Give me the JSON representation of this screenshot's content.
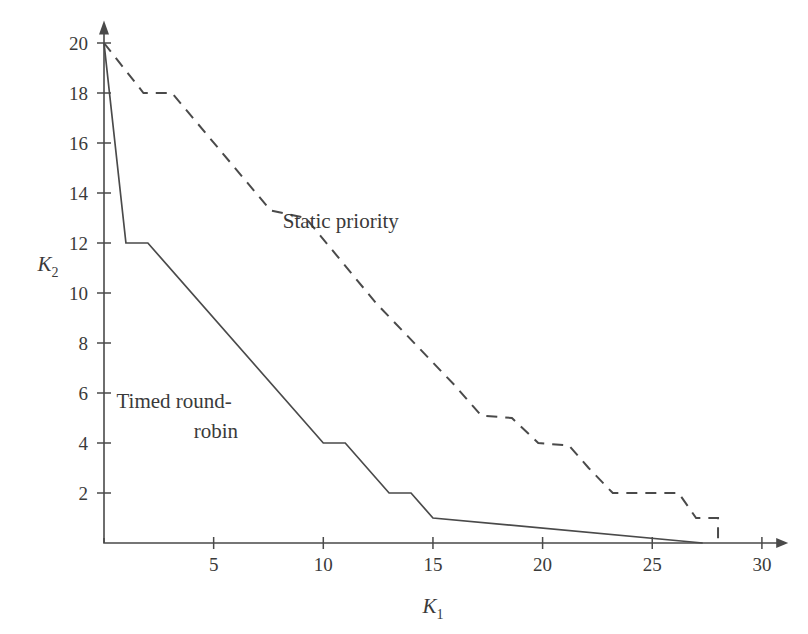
{
  "chart_data": {
    "type": "line",
    "title": "",
    "xlabel": "K1",
    "ylabel": "K2",
    "xlabel_base": "K",
    "xlabel_sub": "1",
    "ylabel_base": "K",
    "ylabel_sub": "2",
    "xlim": [
      0,
      31
    ],
    "ylim": [
      0,
      21
    ],
    "grid": false,
    "legend_position": "inline-annotation",
    "xticks": [
      5,
      10,
      15,
      20,
      25,
      30
    ],
    "xtick_labels": [
      "5",
      "10",
      "15",
      "20",
      "25",
      "30"
    ],
    "yticks": [
      2,
      4,
      6,
      8,
      10,
      12,
      14,
      16,
      18,
      20
    ],
    "ytick_labels": [
      "2",
      "4",
      "6",
      "8",
      "10",
      "12",
      "14",
      "16",
      "18",
      "20"
    ],
    "series": [
      {
        "name": "Timed round-robin",
        "style": "solid",
        "label_text_line1": "Timed round-",
        "label_text_line2": "robin",
        "points": [
          [
            0,
            20
          ],
          [
            1,
            12
          ],
          [
            2,
            12
          ],
          [
            10,
            4
          ],
          [
            11,
            4
          ],
          [
            13,
            2
          ],
          [
            14,
            2
          ],
          [
            15,
            1
          ],
          [
            27.3,
            0
          ]
        ]
      },
      {
        "name": "Static priority",
        "style": "dashed",
        "label_text_line1": "Static priority",
        "label_text_line2": "",
        "points": [
          [
            0,
            20
          ],
          [
            1.8,
            18
          ],
          [
            3.1,
            18
          ],
          [
            7.6,
            13.3
          ],
          [
            9.2,
            13.0
          ],
          [
            12.4,
            9.6
          ],
          [
            16.0,
            6.3
          ],
          [
            17.2,
            5.1
          ],
          [
            18.6,
            5.0
          ],
          [
            19.8,
            4.0
          ],
          [
            21.2,
            3.9
          ],
          [
            22.1,
            3.0
          ],
          [
            23.2,
            2.0
          ],
          [
            26.2,
            2.0
          ],
          [
            27.0,
            1.0
          ],
          [
            28.0,
            1.0
          ],
          [
            28.0,
            0
          ]
        ]
      }
    ],
    "annotations": [
      {
        "text": "Static priority",
        "x": 10.8,
        "y": 12.6
      },
      {
        "text": "Timed round-",
        "x": 3.2,
        "y": 5.4
      },
      {
        "text": "robin",
        "x": 5.1,
        "y": 4.2
      }
    ],
    "colors": {
      "line": "#4a4a4a",
      "text": "#3a3a3a",
      "background": "#ffffff"
    }
  }
}
